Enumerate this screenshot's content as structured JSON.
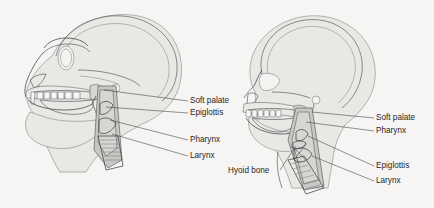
{
  "figure": {
    "background_color": "#f6f5f3",
    "ink_color": "#5c5c60",
    "text_color": "#27272a",
    "soft_tissue_color": "#e9e8e5",
    "vocal_tract_color": "#c9c7c3"
  },
  "panels": [
    {
      "id": "ape-head",
      "name": "chimpanzee-vocal-tract",
      "labels": [
        {
          "id": "soft-palate",
          "text": "Soft palate",
          "x": 190,
          "y": 103
        },
        {
          "id": "epiglottis",
          "text": "Epiglottis",
          "x": 190,
          "y": 115
        },
        {
          "id": "pharynx",
          "text": "Pharynx",
          "x": 190,
          "y": 142
        },
        {
          "id": "larynx",
          "text": "Larynx",
          "x": 190,
          "y": 158
        }
      ]
    },
    {
      "id": "human-head",
      "name": "human-vocal-tract",
      "labels": [
        {
          "id": "soft-palate",
          "text": "Soft palate",
          "x": 376,
          "y": 120
        },
        {
          "id": "pharynx",
          "text": "Pharynx",
          "x": 376,
          "y": 133
        },
        {
          "id": "epiglottis",
          "text": "Epiglottis",
          "x": 376,
          "y": 168
        },
        {
          "id": "larynx",
          "text": "Larynx",
          "x": 376,
          "y": 183
        },
        {
          "id": "hyoid-bone",
          "text": "Hyoid bone",
          "x": 228,
          "y": 173
        }
      ]
    }
  ]
}
